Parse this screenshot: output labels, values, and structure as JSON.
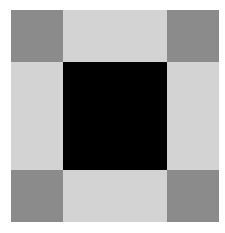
{
  "pattern": {
    "description": "3x3 grid of squares",
    "colors": {
      "corner": "#8b8b8b",
      "edge": "#d3d3d3",
      "center": "#000000",
      "background": "#ffffff"
    },
    "cells": [
      [
        "corner",
        "edge",
        "corner"
      ],
      [
        "edge",
        "center",
        "edge"
      ],
      [
        "corner",
        "edge",
        "corner"
      ]
    ]
  }
}
